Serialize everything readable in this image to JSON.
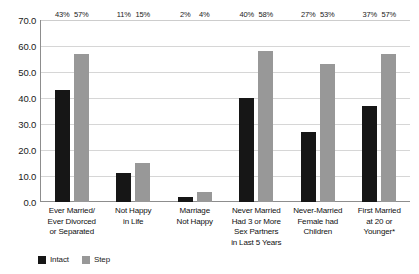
{
  "chart_data": {
    "type": "bar",
    "title": "",
    "subtitle": "",
    "xlabel": "",
    "ylabel": "",
    "ylim": [
      0,
      70
    ],
    "ytick_step": 10,
    "yticks": [
      "0.0",
      "10.0",
      "20.0",
      "30.0",
      "40.0",
      "50.0",
      "60.0",
      "70.0"
    ],
    "grid": true,
    "legend_position": "bottom-left",
    "categories": [
      "Ever Married/ Ever Divorced or Separated",
      "Not Happy in Life",
      "Marriage Not Happy",
      "Never Married Had 3 or More Sex Partners in Last 5 Years",
      "Never-Married Female had Children",
      "First Married at 20 or Younger*"
    ],
    "category_lines": [
      [
        "Ever Married/",
        "Ever Divorced",
        "or Separated"
      ],
      [
        "Not Happy",
        "in Life"
      ],
      [
        "Marriage",
        "Not Happy"
      ],
      [
        "Never Married",
        "Had 3 or More",
        "Sex Partners",
        "in Last 5 Years"
      ],
      [
        "Never-Married",
        "Female had",
        "Children"
      ],
      [
        "First Married",
        "at 20 or",
        "Younger*"
      ]
    ],
    "series": [
      {
        "name": "Intact",
        "color": "#161616",
        "values": [
          43,
          11,
          2,
          40,
          27,
          37
        ],
        "labels": [
          "43%",
          "11%",
          "2%",
          "40%",
          "27%",
          "37%"
        ]
      },
      {
        "name": "Step",
        "color": "#989898",
        "values": [
          57,
          15,
          4,
          58,
          53,
          57
        ],
        "labels": [
          "57%",
          "15%",
          "4%",
          "58%",
          "53%",
          "57%"
        ]
      }
    ]
  },
  "colors": {
    "intact": "#161616",
    "step": "#989898",
    "gridline": "#d6d6d6",
    "axis": "#8d8d8d",
    "background": "#ffffff",
    "text": "#111111"
  }
}
